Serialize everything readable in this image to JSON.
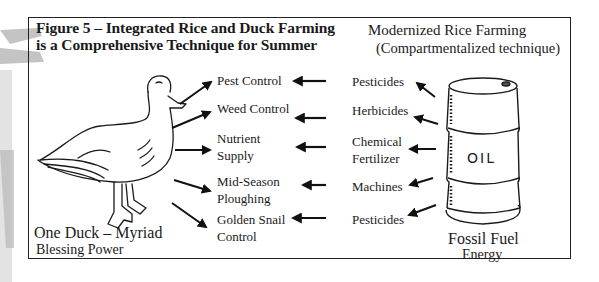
{
  "figure": {
    "title_line1": "Figure 5 – Integrated Rice and Duck Farming",
    "title_line2": "is a Comprehensive Technique for Summer"
  },
  "right_heading": {
    "line1": "Modernized Rice Farming",
    "line2": "(Compartmentalized technique)"
  },
  "duck_caption": {
    "line1": "One Duck – Myriad",
    "line2": "Blessing Power"
  },
  "barrel": {
    "label": "OIL",
    "caption_line1": "Fossil Fuel",
    "caption_line2": "Energy"
  },
  "duck_benefits": [
    {
      "line1": "Pest Control",
      "line2": ""
    },
    {
      "line1": "Weed Control",
      "line2": ""
    },
    {
      "line1": "Nutrient",
      "line2": "Supply"
    },
    {
      "line1": "Mid-Season",
      "line2": "Ploughing"
    },
    {
      "line1": "Golden Snail",
      "line2": "Control"
    }
  ],
  "modern_inputs": [
    {
      "line1": "Pesticides",
      "line2": ""
    },
    {
      "line1": "Herbicides",
      "line2": ""
    },
    {
      "line1": "Chemical",
      "line2": "Fertilizer"
    },
    {
      "line1": "Machines",
      "line2": ""
    },
    {
      "line1": "Pesticides",
      "line2": ""
    }
  ],
  "colors": {
    "ink": "#1a1a1a",
    "frame": "#222222",
    "watermark": "#b8b8b8",
    "background": "#ffffff"
  }
}
